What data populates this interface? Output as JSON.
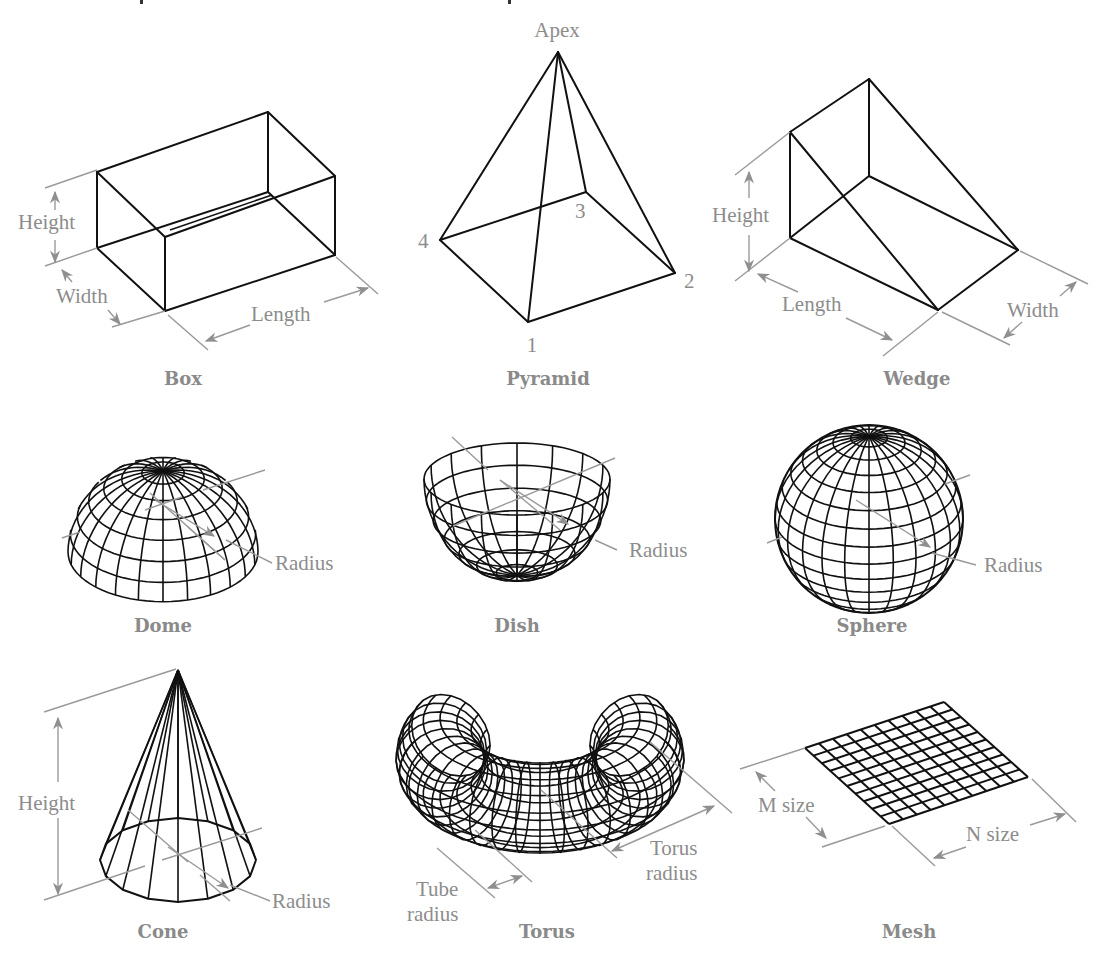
{
  "figure": {
    "top_fragment": {
      "glyph_left": "p",
      "glyph_right": "p"
    },
    "shapes": [
      {
        "id": "box",
        "caption": "Box",
        "labels": {
          "height": "Height",
          "width": "Width",
          "length": "Length"
        }
      },
      {
        "id": "pyramid",
        "caption": "Pyramid",
        "labels": {
          "apex": "Apex",
          "v1": "1",
          "v2": "2",
          "v3": "3",
          "v4": "4"
        }
      },
      {
        "id": "wedge",
        "caption": "Wedge",
        "labels": {
          "height": "Height",
          "length": "Length",
          "width": "Width"
        }
      },
      {
        "id": "dome",
        "caption": "Dome",
        "labels": {
          "radius": "Radius"
        }
      },
      {
        "id": "dish",
        "caption": "Dish",
        "labels": {
          "radius": "Radius"
        }
      },
      {
        "id": "sphere",
        "caption": "Sphere",
        "labels": {
          "radius": "Radius"
        }
      },
      {
        "id": "cone",
        "caption": "Cone",
        "labels": {
          "height": "Height",
          "radius": "Radius"
        }
      },
      {
        "id": "torus",
        "caption": "Torus",
        "labels": {
          "tube_radius_1": "Tube",
          "tube_radius_2": "radius",
          "torus_radius_1": "Torus",
          "torus_radius_2": "radius"
        }
      },
      {
        "id": "mesh",
        "caption": "Mesh",
        "labels": {
          "m_size": "M size",
          "n_size": "N size"
        },
        "grid": {
          "m": 10,
          "n": 10
        }
      }
    ],
    "colors": {
      "object_lines": "#111111",
      "dimension_lines": "#9a9a9a",
      "label_text": "#8c8c8c",
      "background": "#ffffff"
    }
  }
}
